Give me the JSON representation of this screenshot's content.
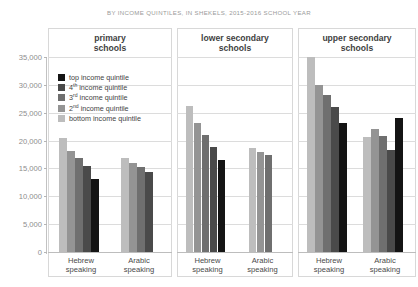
{
  "supertitle": "BY INCOME QUINTILES, IN SHEKELS, 2015-2016 SCHOOL YEAR",
  "legend": {
    "items": [
      {
        "label": "top income quintile",
        "sup": "",
        "color": "#141414"
      },
      {
        "label": " income quintile",
        "sup": "4th",
        "color": "#4a4a4a"
      },
      {
        "label": " income quintile",
        "sup": "3rd",
        "color": "#6f6f6f"
      },
      {
        "label": " income quintile",
        "sup": "2nd",
        "color": "#949494"
      },
      {
        "label": "bottom income quintile",
        "sup": "",
        "color": "#bdbdbd"
      }
    ]
  },
  "chart_data": {
    "type": "bar",
    "title": "BY INCOME QUINTILES, IN SHEKELS, 2015-2016 SCHOOL YEAR",
    "xlabel": "",
    "ylabel": "",
    "ylim": [
      0,
      35000
    ],
    "ytick_values": [
      0,
      5000,
      10000,
      15000,
      20000,
      25000,
      30000,
      35000
    ],
    "ytick_labels": [
      "0",
      "5,000",
      "10,000",
      "15,000",
      "20,000",
      "25,000",
      "30,000",
      "35,000"
    ],
    "grid": true,
    "legend_position": "inside-upper-left-panel-1",
    "series_order_in_group": [
      "bottom income quintile",
      "2nd income quintile",
      "3rd income quintile",
      "4th income quintile",
      "top income quintile"
    ],
    "series_colors": [
      "#bdbdbd",
      "#949494",
      "#6f6f6f",
      "#4a4a4a",
      "#141414"
    ],
    "panels": [
      {
        "name": "primary schools",
        "groups": [
          {
            "name": "Hebrew speaking",
            "label_line1": "Hebrew",
            "label_line2": "speaking",
            "values": [
              20400,
              18100,
              16800,
              15400,
              13100
            ]
          },
          {
            "name": "Arabic speaking",
            "label_line1": "Arabic",
            "label_line2": "speaking",
            "values": [
              16900,
              16000,
              15200,
              14300,
              null
            ]
          }
        ]
      },
      {
        "name": "lower secondary schools",
        "groups": [
          {
            "name": "Hebrew speaking",
            "label_line1": "Hebrew",
            "label_line2": "speaking",
            "values": [
              26200,
              23100,
              21000,
              18800,
              16500
            ]
          },
          {
            "name": "Arabic speaking",
            "label_line1": "Arabic",
            "label_line2": "speaking",
            "values": [
              18600,
              18000,
              17500,
              null,
              null
            ]
          }
        ]
      },
      {
        "name": "upper secondary schools",
        "groups": [
          {
            "name": "Hebrew speaking",
            "label_line1": "Hebrew",
            "label_line2": "speaking",
            "values": [
              35000,
              29900,
              28200,
              26000,
              23200
            ]
          },
          {
            "name": "Arabic speaking",
            "label_line1": "Arabic",
            "label_line2": "speaking",
            "values": [
              20700,
              22000,
              20900,
              18300,
              24000
            ]
          }
        ]
      }
    ]
  },
  "panel_titles": [
    {
      "line1": "primary",
      "line2": "schools"
    },
    {
      "line1": "lower secondary",
      "line2": "schools"
    },
    {
      "line1": "upper secondary",
      "line2": "schools"
    }
  ]
}
